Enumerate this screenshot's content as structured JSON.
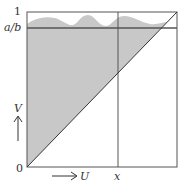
{
  "diagram": {
    "type": "unit-square-region",
    "labels": {
      "top_left": "1",
      "threshold": "a/b",
      "origin": "0",
      "x_marker": "x",
      "u_axis": "U",
      "v_axis": "V"
    },
    "colors": {
      "shade": "#c8c8c8",
      "line": "#555555",
      "threshold_line": "#555555",
      "text": "#333333"
    },
    "elements": [
      "unit square frame",
      "diagonal V=U from (0,0) to (1,1)",
      "horizontal line at V=a/b",
      "vertical line at U=x",
      "shaded region above diagonal with wavy upper boundary near 1",
      "U axis arrow",
      "V axis arrow"
    ]
  }
}
